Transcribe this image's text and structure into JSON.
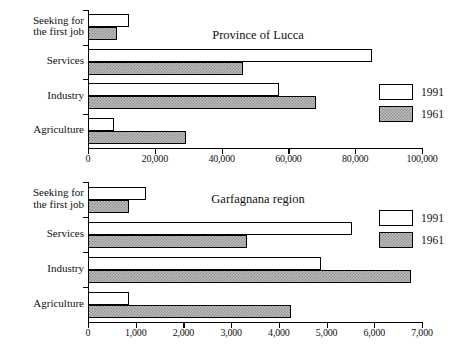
{
  "figure": {
    "kind": "two stacked grouped horizontal bar charts",
    "series_order": [
      "1991",
      "1961"
    ]
  },
  "legend": {
    "items": [
      {
        "name": "legend-1991",
        "label": "1991",
        "fill": "white"
      },
      {
        "name": "legend-1961",
        "label": "1961",
        "fill": "hatched-gray"
      }
    ]
  },
  "chart_data": [
    {
      "type": "bar",
      "orientation": "horizontal",
      "title": "Province of Lucca",
      "categories": [
        "Agriculture",
        "Industry",
        "Services",
        "Seeking for\nthe first job"
      ],
      "category_lines": [
        [
          "Agriculture"
        ],
        [
          "Industry"
        ],
        [
          "Services"
        ],
        [
          "Seeking for",
          "the first job"
        ]
      ],
      "series": [
        {
          "name": "1991",
          "values": [
            7800,
            57200,
            85000,
            12300
          ]
        },
        {
          "name": "1961",
          "values": [
            29300,
            68300,
            46400,
            8600
          ]
        }
      ],
      "xlabel": "",
      "ylabel": "",
      "xlim": [
        0,
        100000
      ],
      "xticks": [
        0,
        20000,
        40000,
        60000,
        80000,
        100000
      ],
      "xticklabels": [
        "0",
        "20,000",
        "40,000",
        "60,000",
        "80,000",
        "100,000"
      ],
      "grid": false,
      "legend_position": "right-middle"
    },
    {
      "type": "bar",
      "orientation": "horizontal",
      "title": "Garfagnana region",
      "categories": [
        "Agriculture",
        "Industry",
        "Services",
        "Seeking for\nthe first job"
      ],
      "category_lines": [
        [
          "Agriculture"
        ],
        [
          "Industry"
        ],
        [
          "Services"
        ],
        [
          "Seeking for",
          "the first job"
        ]
      ],
      "series": [
        {
          "name": "1991",
          "values": [
            860,
            4880,
            5530,
            1220
          ]
        },
        {
          "name": "1961",
          "values": [
            4250,
            6770,
            3330,
            860
          ]
        }
      ],
      "xlabel": "",
      "ylabel": "",
      "xlim": [
        0,
        7000
      ],
      "xticks": [
        0,
        1000,
        2000,
        3000,
        4000,
        5000,
        6000,
        7000
      ],
      "xticklabels": [
        "0",
        "1,000",
        "2,000",
        "3,000",
        "4,000",
        "5,000",
        "6,000",
        "7,000"
      ],
      "grid": false,
      "legend_position": "right-upper"
    }
  ],
  "colors": {
    "axis": "#000000",
    "bar_1991": "#ffffff",
    "bar_1961": "#bdbdbd",
    "text": "#111111",
    "background": "#ffffff"
  }
}
